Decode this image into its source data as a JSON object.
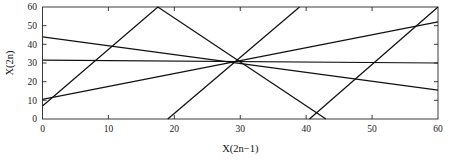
{
  "figure": {
    "background_color": "#ffffff",
    "line_color": "#111111",
    "axis_color": "#262626"
  },
  "chart_data": {
    "type": "line",
    "title": "",
    "subtitle": "",
    "xlabel": "X(2n−1)",
    "ylabel": "X(2n)",
    "xlim": [
      0,
      60
    ],
    "ylim": [
      0,
      60
    ],
    "xticks": [
      0,
      10,
      20,
      30,
      40,
      50,
      60
    ],
    "yticks": [
      0,
      10,
      20,
      30,
      40,
      50,
      60
    ],
    "xtick_labels": [
      "0",
      "10",
      "20",
      "30",
      "40",
      "50",
      "60"
    ],
    "ytick_labels": [
      "0",
      "10",
      "20",
      "30",
      "40",
      "50",
      "60"
    ],
    "grid": false,
    "legend": null,
    "legend_position": "none",
    "annotations": [],
    "series": [
      {
        "name": "segment-1",
        "points": [
          [
            0,
            44
          ],
          [
            60,
            15.5
          ]
        ]
      },
      {
        "name": "segment-2",
        "points": [
          [
            0,
            31.5
          ],
          [
            60,
            30
          ]
        ]
      },
      {
        "name": "segment-3",
        "points": [
          [
            0,
            10.5
          ],
          [
            60,
            52
          ]
        ]
      },
      {
        "name": "segment-4",
        "points": [
          [
            0,
            7
          ],
          [
            17.5,
            60
          ],
          [
            43,
            0
          ]
        ]
      },
      {
        "name": "segment-5",
        "points": [
          [
            19,
            0
          ],
          [
            39,
            60
          ]
        ]
      },
      {
        "name": "segment-6",
        "points": [
          [
            40.5,
            0
          ],
          [
            60,
            60
          ]
        ]
      }
    ]
  }
}
